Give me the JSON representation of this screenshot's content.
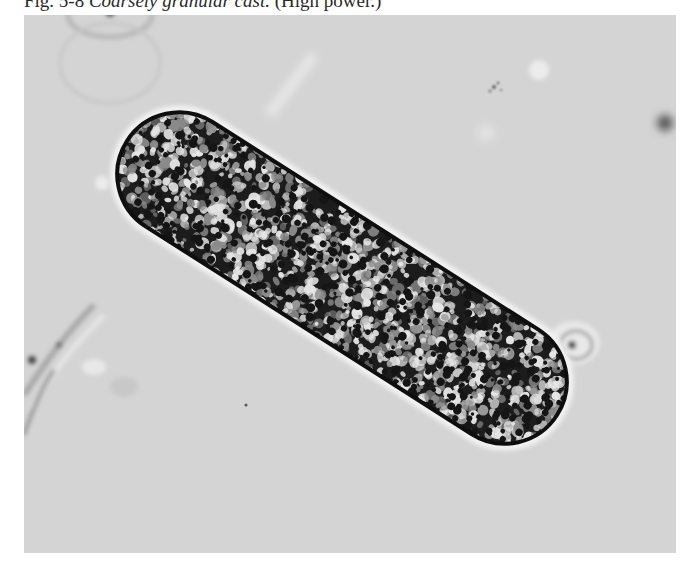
{
  "figure": {
    "number": "Fig. 5-8",
    "title": "Coarsely granular cast.",
    "magnification": "(High power.)"
  },
  "photo": {
    "subject": "coarsely granular cast",
    "description": "Micrograph of a coarsely granular urinary cast under high power magnification",
    "colors": {
      "background": "#d4d4d4",
      "granule_dark": "#151515",
      "granule_light": "#e6e6e6",
      "halo": "#f2f2f2"
    }
  }
}
